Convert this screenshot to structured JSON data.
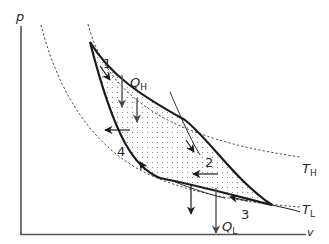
{
  "diagram": {
    "type": "p-v diagram (Carnot cycle between two isotherms)",
    "axes": {
      "y_label": "p",
      "x_label": "v"
    },
    "isotherms": [
      {
        "name": "T_H",
        "label_main": "T",
        "label_sub": "H",
        "style": "dashed"
      },
      {
        "name": "T_L",
        "label_main": "T",
        "label_sub": "L",
        "style": "dashed"
      }
    ],
    "heat": {
      "in": {
        "label_main": "Q",
        "label_sub": "H"
      },
      "out": {
        "label_main": "Q",
        "label_sub": "L"
      }
    },
    "states": [
      {
        "label": "1"
      },
      {
        "label": "2"
      },
      {
        "label": "3"
      },
      {
        "label": "4"
      }
    ],
    "colors": {
      "cycle_line": "#1a1a1a",
      "axis": "#444444",
      "isotherm": "#444444",
      "heat_arrow": "#555555",
      "dots": "#777777"
    }
  }
}
